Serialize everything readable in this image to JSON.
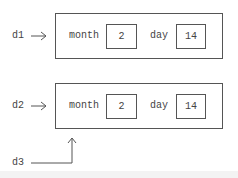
{
  "objects": [
    {
      "ref": "d1",
      "fields": [
        {
          "name": "month",
          "value": "2"
        },
        {
          "name": "day",
          "value": "14"
        }
      ]
    },
    {
      "ref": "d2",
      "fields": [
        {
          "name": "month",
          "value": "2"
        },
        {
          "name": "day",
          "value": "14"
        }
      ]
    }
  ],
  "extra_ref": "d3",
  "colors": {
    "line": "#555555",
    "text": "#444444",
    "background": "#ffffff"
  }
}
